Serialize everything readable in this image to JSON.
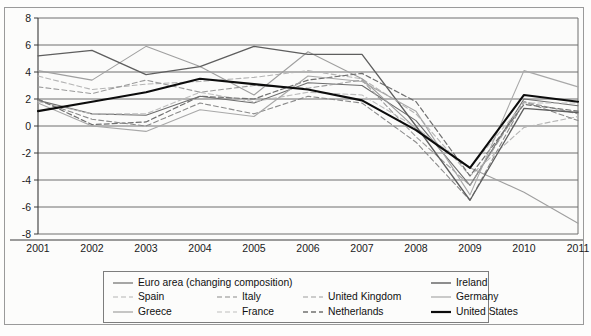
{
  "chart_data": {
    "type": "line",
    "title": "",
    "xlabel": "",
    "ylabel": "",
    "x": [
      2001,
      2002,
      2003,
      2004,
      2005,
      2006,
      2007,
      2008,
      2009,
      2010,
      2011
    ],
    "categories": [
      "2001",
      "2002",
      "2003",
      "2004",
      "2005",
      "2006",
      "2007",
      "2008",
      "2009",
      "2010",
      "2011"
    ],
    "ylim": [
      -8,
      8
    ],
    "ytick_labels": [
      "8",
      "6",
      "4",
      "2",
      "0",
      "-2",
      "-4",
      "-6",
      "-8"
    ],
    "yticks": [
      8,
      6,
      4,
      2,
      0,
      -2,
      -4,
      -6,
      -8
    ],
    "grid": "horizontal",
    "legend_position": "bottom",
    "series": [
      {
        "name": "Euro area (changing composition)",
        "style": "solid",
        "color": "#6d6d6d",
        "width": 1.1,
        "values": [
          1.9,
          0.9,
          0.8,
          2.2,
          1.7,
          3.2,
          3.0,
          0.4,
          -4.4,
          2.0,
          1.5
        ]
      },
      {
        "name": "Spain",
        "style": "dashed-light",
        "color": "#b4b4b4",
        "width": 1.1,
        "values": [
          3.7,
          2.7,
          3.1,
          3.3,
          3.6,
          4.1,
          3.5,
          0.9,
          -3.7,
          -0.1,
          0.7
        ]
      },
      {
        "name": "Italy",
        "style": "dashed",
        "color": "#8a8a8a",
        "width": 1.1,
        "values": [
          1.9,
          0.5,
          0.0,
          1.7,
          0.9,
          2.2,
          1.7,
          -1.2,
          -5.5,
          1.8,
          0.4
        ]
      },
      {
        "name": "United Kingdom",
        "style": "dashed",
        "color": "#9b9b9b",
        "width": 1.1,
        "values": [
          2.9,
          2.4,
          3.4,
          2.5,
          3.0,
          2.8,
          3.4,
          -0.8,
          -4.4,
          1.8,
          0.9
        ]
      },
      {
        "name": "Greece",
        "style": "solid",
        "color": "#9f9f9f",
        "width": 1.1,
        "values": [
          4.1,
          3.4,
          5.9,
          4.4,
          2.3,
          5.5,
          3.5,
          -0.2,
          -3.1,
          -4.9,
          -7.2
        ]
      },
      {
        "name": "France",
        "style": "dashed-light",
        "color": "#bdbdbd",
        "width": 1.1,
        "values": [
          1.8,
          0.9,
          0.9,
          2.5,
          1.8,
          2.5,
          2.3,
          -0.1,
          -3.1,
          1.7,
          1.7
        ]
      },
      {
        "name": "Netherlands",
        "style": "dashed-dark",
        "color": "#707070",
        "width": 1.2,
        "values": [
          2.0,
          0.1,
          0.3,
          2.2,
          2.0,
          3.4,
          3.9,
          1.8,
          -3.7,
          1.6,
          1.1
        ]
      },
      {
        "name": "Ireland",
        "style": "solid",
        "color": "#5e5e5e",
        "width": 1.3,
        "values": [
          5.2,
          5.6,
          3.8,
          4.4,
          5.9,
          5.3,
          5.3,
          0.0,
          -5.5,
          1.3,
          1.0
        ]
      },
      {
        "name": "Germany",
        "style": "solid",
        "color": "#a8a8a8",
        "width": 1.1,
        "values": [
          1.7,
          0.0,
          -0.4,
          1.2,
          0.7,
          3.7,
          3.3,
          1.1,
          -5.1,
          4.1,
          2.9
        ]
      },
      {
        "name": "United States",
        "style": "solid",
        "color": "#0c0c0c",
        "width": 2.1,
        "values": [
          1.1,
          1.8,
          2.5,
          3.5,
          3.1,
          2.7,
          1.9,
          -0.3,
          -3.1,
          2.3,
          1.8
        ]
      }
    ]
  },
  "legend": {
    "rows": [
      [
        {
          "label": "Euro area (changing composition)",
          "style": "solid",
          "color": "#6d6d6d",
          "width": 1.2
        },
        {
          "label": "Ireland",
          "style": "solid",
          "color": "#5e5e5e",
          "width": 1.4
        }
      ],
      [
        {
          "label": "Spain",
          "style": "dashed-light",
          "color": "#b4b4b4",
          "width": 1.2
        },
        {
          "label": "Italy",
          "style": "dashed",
          "color": "#8a8a8a",
          "width": 1.2
        },
        {
          "label": "United Kingdom",
          "style": "dashed",
          "color": "#9b9b9b",
          "width": 1.2
        },
        {
          "label": "Germany",
          "style": "solid",
          "color": "#a8a8a8",
          "width": 1.2
        }
      ],
      [
        {
          "label": "Greece",
          "style": "solid",
          "color": "#9f9f9f",
          "width": 1.2
        },
        {
          "label": "France",
          "style": "dashed-light",
          "color": "#bdbdbd",
          "width": 1.2
        },
        {
          "label": "Netherlands",
          "style": "dashed-dark",
          "color": "#707070",
          "width": 1.4
        },
        {
          "label": "United States",
          "style": "solid",
          "color": "#0c0c0c",
          "width": 2.2
        }
      ]
    ]
  },
  "colors": {
    "frame": "#9a9a9a",
    "grid": "#6f6f6f",
    "axis": "#3a3a3a",
    "plot_background": "#fbfbfa",
    "text": "#1a1a1a"
  }
}
